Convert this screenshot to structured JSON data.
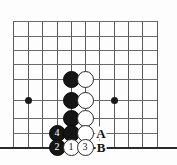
{
  "figure": {
    "kind": "go-board-diagram",
    "width": 177,
    "height": 165,
    "background_color": "#fdfdfd",
    "line_color": "#6a6a6a",
    "edge_line_color": "#2a2a2a",
    "black_stone_color": "#151515",
    "white_stone_color": "#ffffff"
  },
  "grid": {
    "spacing": 14.3,
    "vertical_lines_x": [
      13,
      28,
      42,
      57,
      71,
      85,
      99,
      114,
      128,
      142,
      157
    ],
    "horizontal_lines_y": [
      21,
      36,
      50,
      64,
      79,
      100,
      118,
      133,
      147
    ],
    "bottom_edge_y": 147,
    "star_points": [
      {
        "name": "star-point-left",
        "x": 28,
        "y": 100
      },
      {
        "name": "star-point-right",
        "x": 114,
        "y": 100
      }
    ]
  },
  "stones": [
    {
      "name": "black-stone-1",
      "color": "black",
      "x": 71,
      "y": 79,
      "label": ""
    },
    {
      "name": "white-stone-1",
      "color": "white",
      "x": 85,
      "y": 79,
      "label": ""
    },
    {
      "name": "black-stone-2",
      "color": "black",
      "x": 71,
      "y": 100,
      "label": ""
    },
    {
      "name": "white-stone-2",
      "color": "white",
      "x": 85,
      "y": 100,
      "label": ""
    },
    {
      "name": "black-stone-3",
      "color": "black",
      "x": 71,
      "y": 118,
      "label": ""
    },
    {
      "name": "white-stone-3",
      "color": "white",
      "x": 85,
      "y": 118,
      "label": ""
    },
    {
      "name": "black-stone-move-4",
      "color": "black",
      "x": 57,
      "y": 133,
      "label": "4"
    },
    {
      "name": "black-stone-4",
      "color": "black",
      "x": 71,
      "y": 133,
      "label": ""
    },
    {
      "name": "white-stone-4",
      "color": "white",
      "x": 85,
      "y": 133,
      "label": ""
    },
    {
      "name": "black-stone-move-2",
      "color": "black",
      "x": 57,
      "y": 147,
      "label": "2"
    },
    {
      "name": "white-stone-move-1",
      "color": "white",
      "x": 71,
      "y": 147,
      "label": "1"
    },
    {
      "name": "white-stone-move-3",
      "color": "white",
      "x": 85,
      "y": 147,
      "label": "3"
    }
  ],
  "point_labels": [
    {
      "name": "point-label-a",
      "text": "A",
      "x": 101,
      "y": 133
    },
    {
      "name": "point-label-b",
      "text": "B",
      "x": 101,
      "y": 147
    }
  ]
}
